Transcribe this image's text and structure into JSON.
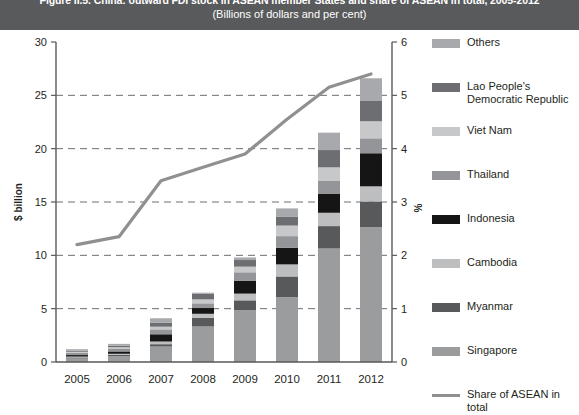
{
  "header": {
    "title": "Figure II.5. China: outward FDI stock in ASEAN member States and share of ASEAN in total, 2005-2012",
    "subtitle": "(Billions of dollars and per cent)"
  },
  "axes": {
    "left_label": "$ billion",
    "right_label": "%",
    "left_ticks": [
      "30",
      "25",
      "20",
      "15",
      "10",
      "5",
      "0"
    ],
    "right_ticks": [
      "6",
      "5",
      "4",
      "3",
      "2",
      "1",
      "0"
    ],
    "x_ticks": [
      "2005",
      "2006",
      "2007",
      "2008",
      "2009",
      "2010",
      "2011",
      "2012"
    ]
  },
  "legend": {
    "items": [
      {
        "label": "Others",
        "color": "#a7a9ac",
        "type": "box"
      },
      {
        "label": "Lao People's Democratic Republic",
        "color": "#6d6e71",
        "type": "box"
      },
      {
        "label": "Viet Nam",
        "color": "#c7c8ca",
        "type": "box"
      },
      {
        "label": "Thailand",
        "color": "#939598",
        "type": "box"
      },
      {
        "label": "Indonesia",
        "color": "#151515",
        "type": "box"
      },
      {
        "label": "Cambodia",
        "color": "#bcbec0",
        "type": "box"
      },
      {
        "label": "Myanmar",
        "color": "#58595b",
        "type": "box"
      },
      {
        "label": "Singapore",
        "color": "#9a9c9e",
        "type": "box"
      },
      {
        "label": "Share of ASEAN in total",
        "color": "#8e9091",
        "type": "line"
      }
    ]
  },
  "chart_data": {
    "type": "bar",
    "title": "Figure II.5. China: outward FDI stock in ASEAN member States and share of ASEAN in total, 2005-2012",
    "subtitle": "(Billions of dollars and per cent)",
    "xlabel": "",
    "ylabel": "$ billion",
    "y2label": "%",
    "ylim": [
      0,
      30
    ],
    "y2lim": [
      0,
      6
    ],
    "grid": true,
    "legend_position": "right",
    "categories": [
      "2005",
      "2006",
      "2007",
      "2008",
      "2009",
      "2010",
      "2011",
      "2012"
    ],
    "stacked": true,
    "stack_order_bottom_to_top": [
      "Singapore",
      "Myanmar",
      "Cambodia",
      "Indonesia",
      "Thailand",
      "Viet Nam",
      "Lao People's Democratic Republic",
      "Others"
    ],
    "series": [
      {
        "name": "Singapore",
        "color": "#9a9c9e",
        "values": [
          0.33,
          0.55,
          1.45,
          3.33,
          4.85,
          6.07,
          10.64,
          12.65
        ]
      },
      {
        "name": "Myanmar",
        "color": "#58595b",
        "values": [
          0.1,
          0.12,
          0.22,
          0.8,
          0.93,
          1.95,
          2.1,
          2.4
        ]
      },
      {
        "name": "Cambodia",
        "color": "#bcbec0",
        "values": [
          0.08,
          0.1,
          0.25,
          0.39,
          0.63,
          1.13,
          1.25,
          1.42
        ]
      },
      {
        "name": "Indonesia",
        "color": "#151515",
        "values": [
          0.14,
          0.22,
          0.68,
          0.54,
          1.22,
          1.57,
          1.8,
          3.1
        ]
      },
      {
        "name": "Thailand",
        "color": "#939598",
        "values": [
          0.22,
          0.28,
          0.46,
          0.44,
          0.78,
          1.08,
          1.18,
          1.4
        ]
      },
      {
        "name": "Viet Nam",
        "color": "#c7c8ca",
        "values": [
          0.09,
          0.12,
          0.25,
          0.37,
          0.53,
          0.99,
          1.28,
          1.6
        ]
      },
      {
        "name": "Lao People's Democratic Republic",
        "color": "#6d6e71",
        "values": [
          0.1,
          0.13,
          0.36,
          0.55,
          0.62,
          0.85,
          1.62,
          1.9
        ]
      },
      {
        "name": "Others",
        "color": "#a7a9ac",
        "values": [
          0.14,
          0.18,
          0.43,
          0.08,
          0.24,
          0.76,
          1.63,
          2.13
        ]
      }
    ],
    "totals": [
      1.2,
      1.7,
      4.1,
      6.5,
      9.8,
      14.4,
      21.5,
      26.6
    ],
    "line_series": {
      "name": "Share of ASEAN in total",
      "color": "#8e9091",
      "axis": "right",
      "unit": "per cent",
      "values": [
        2.2,
        2.35,
        3.4,
        3.65,
        3.9,
        4.55,
        5.15,
        5.4
      ]
    }
  }
}
